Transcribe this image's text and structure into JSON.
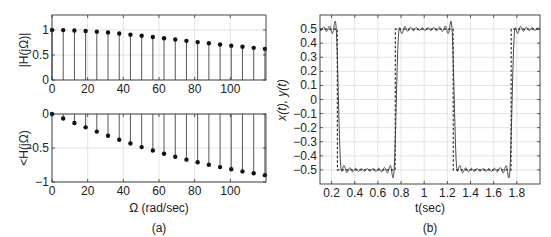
{
  "figure": {
    "panel_a_label": "(a)",
    "panel_b_label": "(b)"
  },
  "chart_data": [
    {
      "id": "magnitude",
      "type": "stem",
      "title": "",
      "xlabel": "",
      "ylabel": "|H(jΩ)|",
      "xlim": [
        0,
        120
      ],
      "ylim": [
        0,
        1.3
      ],
      "xticks": [
        0,
        20,
        40,
        60,
        80,
        100
      ],
      "yticks": [
        0,
        0.5,
        1
      ],
      "ytick_labels": [
        "0",
        "0.5",
        "1"
      ],
      "grid": true,
      "x": [
        0,
        6.28,
        12.57,
        18.85,
        25.13,
        31.42,
        37.7,
        43.98,
        50.27,
        56.55,
        62.83,
        69.12,
        75.4,
        81.68,
        87.96,
        94.25,
        100.53,
        106.81,
        113.1,
        119.38
      ],
      "values": [
        1.0,
        0.998,
        0.991,
        0.981,
        0.967,
        0.949,
        0.929,
        0.907,
        0.884,
        0.859,
        0.834,
        0.809,
        0.783,
        0.758,
        0.734,
        0.71,
        0.687,
        0.664,
        0.643,
        0.623
      ]
    },
    {
      "id": "phase",
      "type": "stem",
      "title": "",
      "xlabel": "Ω (rad/sec)",
      "ylabel": "<H(jΩ)",
      "xlim": [
        0,
        120
      ],
      "ylim": [
        -1,
        0
      ],
      "xticks": [
        0,
        20,
        40,
        60,
        80,
        100
      ],
      "yticks": [
        -1,
        -0.5,
        0
      ],
      "ytick_labels": [
        "−1",
        "−0.5",
        "0"
      ],
      "grid": true,
      "x": [
        0,
        6.28,
        12.57,
        18.85,
        25.13,
        31.42,
        37.7,
        43.98,
        50.27,
        56.55,
        62.83,
        69.12,
        75.4,
        81.68,
        87.96,
        94.25,
        100.53,
        106.81,
        113.1,
        119.38
      ],
      "values": [
        0,
        -0.066,
        -0.132,
        -0.196,
        -0.259,
        -0.32,
        -0.378,
        -0.433,
        -0.487,
        -0.537,
        -0.584,
        -0.629,
        -0.671,
        -0.71,
        -0.747,
        -0.781,
        -0.813,
        -0.844,
        -0.872,
        -0.899
      ]
    },
    {
      "id": "time_response",
      "type": "line",
      "title": "",
      "xlabel": "t(sec)",
      "ylabel": "x(t), y(t)",
      "xlim": [
        0.1,
        2.0
      ],
      "ylim": [
        -0.6,
        0.6
      ],
      "xticks": [
        0.2,
        0.4,
        0.6,
        0.8,
        1,
        1.2,
        1.4,
        1.6,
        1.8
      ],
      "xtick_labels": [
        "0.2",
        "0.4",
        "0.6",
        "0.8",
        "1",
        "1.2",
        "1.4",
        "1.6",
        "1.8"
      ],
      "yticks": [
        -0.5,
        -0.4,
        -0.3,
        -0.2,
        -0.1,
        0,
        0.1,
        0.2,
        0.3,
        0.4,
        0.5
      ],
      "ytick_labels": [
        "−0.5",
        "−0.4",
        "−0.3",
        "−0.2",
        "−0.1",
        "0",
        "0.1",
        "0.2",
        "0.3",
        "0.4",
        "0.5"
      ],
      "grid": true,
      "series": [
        {
          "name": "x(t)",
          "style": "dashed",
          "description": "square wave, amplitude ±0.5, period 1 s, transitions at t=0.25, 0.75, 1.25, 1.75",
          "amplitude": 0.5,
          "period": 1,
          "transitions": [
            0.25,
            0.75,
            1.25,
            1.75
          ]
        },
        {
          "name": "y(t)",
          "style": "solid",
          "description": "filtered square wave with Gibbs ripple (20 harmonics), slightly delayed",
          "harmonics": 20
        }
      ]
    }
  ]
}
